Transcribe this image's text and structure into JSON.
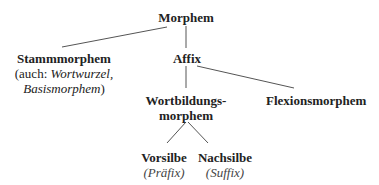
{
  "diagram": {
    "root": {
      "label": "Morphem"
    },
    "stamm": {
      "label": "Stammmorphem",
      "note_prefix": "(auch: ",
      "note_italic1": "Wortwurzel,",
      "note_italic2": "Basismorphem",
      "note_suffix": ")"
    },
    "affix": {
      "label": "Affix"
    },
    "wortbildung": {
      "label1": "Wortbildungs-",
      "label2": "morphem"
    },
    "flexion": {
      "label": "Flexionsmorphem"
    },
    "vorsilbe": {
      "label": "Vorsilbe",
      "sub": "(Präfix)"
    },
    "nachsilbe": {
      "label": "Nachsilbe",
      "sub": "(Suffix)"
    }
  }
}
